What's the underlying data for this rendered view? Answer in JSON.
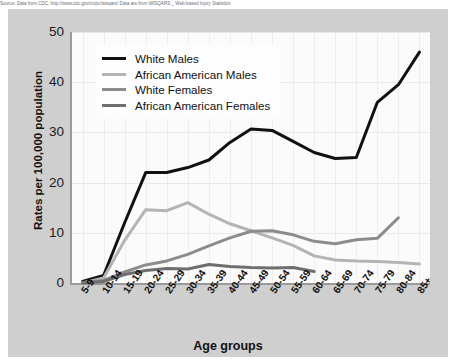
{
  "topnote": {
    "text": "Source: Data from CDC, http://www.cdc.gov/ncipc/wisqars/ Data are from WISQARS _ Web-based Injury Statistics"
  },
  "chart_data": {
    "type": "line",
    "title": "",
    "xlabel": "Age groups",
    "ylabel": "Rates per 100,000 population",
    "categories": [
      "5-9",
      "10-14",
      "15-19",
      "20-24",
      "25-29",
      "30-34",
      "35-39",
      "40-44",
      "45-49",
      "50-54",
      "55-59",
      "60-64",
      "65-69",
      "70-74",
      "75-79",
      "80-84",
      "85+"
    ],
    "ylim": [
      0,
      50
    ],
    "yticks": [
      0,
      10,
      20,
      30,
      40,
      50
    ],
    "grid": true,
    "legend_position": "top-left",
    "series": [
      {
        "name": "White Males",
        "color": "#111111",
        "width": 3.0,
        "values": [
          0.3,
          1.5,
          12.0,
          22.0,
          22.0,
          23.0,
          24.5,
          28.0,
          30.7,
          30.4,
          28.2,
          26.0,
          24.8,
          25.0,
          36.0,
          39.5,
          46.0
        ]
      },
      {
        "name": "African American Males",
        "color": "#b4b4b4",
        "width": 3.0,
        "values": [
          0.0,
          1.0,
          8.5,
          14.6,
          14.4,
          16.0,
          13.7,
          11.8,
          10.4,
          9.0,
          7.5,
          5.4,
          4.6,
          4.4,
          4.3,
          4.1,
          3.8
        ]
      },
      {
        "name": "White Females",
        "color": "#8c8c8c",
        "width": 3.0,
        "values": [
          0.1,
          0.5,
          2.2,
          3.6,
          4.4,
          5.7,
          7.4,
          9.0,
          10.3,
          10.4,
          9.6,
          8.3,
          7.8,
          8.6,
          8.9,
          13.0,
          null
        ]
      },
      {
        "name": "African American Females",
        "color": "#6e6e6e",
        "width": 3.0,
        "values": [
          0.0,
          0.3,
          1.7,
          2.5,
          2.9,
          2.8,
          3.7,
          3.3,
          3.1,
          3.0,
          3.1,
          2.3,
          null,
          null,
          null,
          null,
          null
        ]
      }
    ]
  }
}
